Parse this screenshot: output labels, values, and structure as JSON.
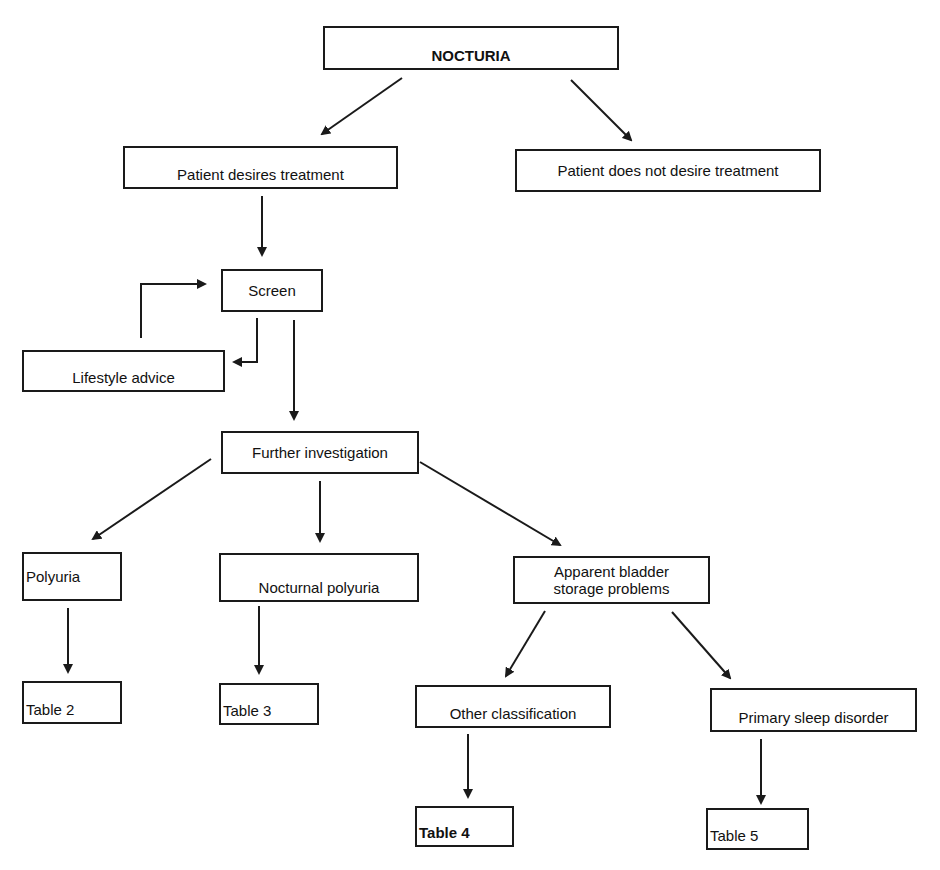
{
  "diagram": {
    "title": "NOCTURIA",
    "nodes": [
      {
        "id": "nocturia",
        "label": "NOCTURIA",
        "x": 323,
        "y": 26,
        "w": 296,
        "h": 44,
        "bold": true,
        "align": "center",
        "pad_top": 20,
        "font": 15
      },
      {
        "id": "desires",
        "label": "Patient desires treatment",
        "x": 123,
        "y": 146,
        "w": 275,
        "h": 43,
        "align": "center",
        "pad_top": 10,
        "font": 15
      },
      {
        "id": "not-desire",
        "label": "Patient does not desire treatment",
        "x": 515,
        "y": 149,
        "w": 306,
        "h": 43,
        "align": "center",
        "font": 15
      },
      {
        "id": "screen",
        "label": "Screen",
        "x": 221,
        "y": 269,
        "w": 102,
        "h": 43,
        "align": "center",
        "font": 15
      },
      {
        "id": "lifestyle",
        "label": "Lifestyle advice",
        "x": 22,
        "y": 350,
        "w": 203,
        "h": 42,
        "align": "center",
        "pad_top": 14,
        "font": 15
      },
      {
        "id": "further",
        "label": "Further investigation",
        "x": 221,
        "y": 431,
        "w": 198,
        "h": 43,
        "align": "center",
        "font": 15
      },
      {
        "id": "polyuria",
        "label": "Polyuria",
        "x": 22,
        "y": 552,
        "w": 100,
        "h": 49,
        "align": "left",
        "font": 15
      },
      {
        "id": "nocturnal",
        "label": "Nocturnal polyuria",
        "x": 219,
        "y": 553,
        "w": 200,
        "h": 49,
        "align": "center",
        "pad_top": 10,
        "font": 15
      },
      {
        "id": "bladder",
        "label": "Apparent bladder\nstorage problems",
        "x": 513,
        "y": 556,
        "w": 197,
        "h": 48,
        "align": "center",
        "font": 15
      },
      {
        "id": "table2",
        "label": "Table 2",
        "x": 22,
        "y": 681,
        "w": 100,
        "h": 43,
        "align": "left",
        "pad_top": 12,
        "font": 15
      },
      {
        "id": "table3",
        "label": "Table 3",
        "x": 219,
        "y": 683,
        "w": 100,
        "h": 42,
        "align": "left",
        "pad_top": 12,
        "font": 15
      },
      {
        "id": "other",
        "label": "Other classification",
        "x": 415,
        "y": 685,
        "w": 196,
        "h": 43,
        "align": "center",
        "pad_top": 10,
        "font": 15
      },
      {
        "id": "sleep",
        "label": "Primary sleep disorder",
        "x": 710,
        "y": 688,
        "w": 207,
        "h": 44,
        "align": "center",
        "pad_top": 10,
        "font": 15
      },
      {
        "id": "table4",
        "label": "Table 4",
        "x": 415,
        "y": 806,
        "w": 99,
        "h": 41,
        "align": "left",
        "pad_top": 12,
        "bold": true,
        "font": 15
      },
      {
        "id": "table5",
        "label": "Table 5",
        "x": 706,
        "y": 808,
        "w": 103,
        "h": 42,
        "align": "left",
        "pad_top": 14,
        "font": 15
      }
    ],
    "edges": [
      {
        "id": "nocturia-to-desires",
        "from": "nocturia",
        "to": "desires",
        "points": [
          [
            402,
            78
          ],
          [
            322,
            134
          ]
        ]
      },
      {
        "id": "nocturia-to-not-desire",
        "from": "nocturia",
        "to": "not-desire",
        "points": [
          [
            571,
            80
          ],
          [
            631,
            140
          ]
        ]
      },
      {
        "id": "desires-to-screen",
        "from": "desires",
        "to": "screen",
        "points": [
          [
            262,
            196
          ],
          [
            262,
            255
          ]
        ]
      },
      {
        "id": "screen-to-lifestyle",
        "from": "screen",
        "to": "lifestyle",
        "points": [
          [
            257,
            318
          ],
          [
            257,
            362
          ],
          [
            234,
            362
          ]
        ]
      },
      {
        "id": "lifestyle-to-screen",
        "from": "lifestyle",
        "to": "screen",
        "points": [
          [
            141,
            338
          ],
          [
            141,
            284
          ],
          [
            205,
            284
          ]
        ]
      },
      {
        "id": "screen-to-further",
        "from": "screen",
        "to": "further",
        "points": [
          [
            294,
            320
          ],
          [
            294,
            419
          ]
        ]
      },
      {
        "id": "further-to-polyuria",
        "from": "further",
        "to": "polyuria",
        "points": [
          [
            211,
            459
          ],
          [
            93,
            539
          ]
        ]
      },
      {
        "id": "further-to-nocturnal",
        "from": "further",
        "to": "nocturnal",
        "points": [
          [
            320,
            481
          ],
          [
            320,
            541
          ]
        ]
      },
      {
        "id": "further-to-bladder",
        "from": "further",
        "to": "bladder",
        "points": [
          [
            420,
            462
          ],
          [
            560,
            545
          ]
        ]
      },
      {
        "id": "polyuria-to-table2",
        "from": "polyuria",
        "to": "table2",
        "points": [
          [
            68,
            608
          ],
          [
            68,
            672
          ]
        ]
      },
      {
        "id": "nocturnal-to-table3",
        "from": "nocturnal",
        "to": "table3",
        "points": [
          [
            259,
            606
          ],
          [
            259,
            673
          ]
        ]
      },
      {
        "id": "bladder-to-other",
        "from": "bladder",
        "to": "other",
        "points": [
          [
            545,
            611
          ],
          [
            506,
            676
          ]
        ]
      },
      {
        "id": "bladder-to-sleep",
        "from": "bladder",
        "to": "sleep",
        "points": [
          [
            672,
            612
          ],
          [
            730,
            678
          ]
        ]
      },
      {
        "id": "other-to-table4",
        "from": "other",
        "to": "table4",
        "points": [
          [
            468,
            734
          ],
          [
            468,
            797
          ]
        ]
      },
      {
        "id": "sleep-to-table5",
        "from": "sleep",
        "to": "table5",
        "points": [
          [
            761,
            739
          ],
          [
            761,
            803
          ]
        ]
      }
    ],
    "colors": {
      "line": "#1a1a1a",
      "text": "#111111",
      "background": "#ffffff"
    }
  }
}
